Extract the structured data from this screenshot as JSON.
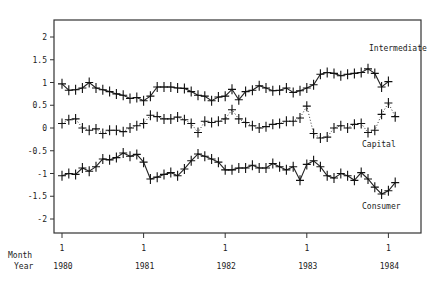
{
  "chart_data": {
    "type": "line",
    "title": "",
    "xlabel_rows": [
      "Month",
      "Year"
    ],
    "ylabel": "",
    "ylim": [
      -2.4,
      2.4
    ],
    "yticks": [
      2,
      1.5,
      1,
      0.5,
      0,
      -0.5,
      -1,
      -1.5,
      -2
    ],
    "ytick_labels": [
      "2",
      "1.5",
      "1",
      "0.5",
      "0",
      "-0.5",
      "-1",
      "-1.5",
      "-2"
    ],
    "xticks": [
      {
        "month": "1",
        "year": "1980",
        "index": 0
      },
      {
        "month": "1",
        "year": "1981",
        "index": 12
      },
      {
        "month": "1",
        "year": "1982",
        "index": 24
      },
      {
        "month": "1",
        "year": "1983",
        "index": 36
      },
      {
        "month": "1",
        "year": "1984",
        "index": 48
      }
    ],
    "grid": false,
    "legend": "inline labels",
    "marker": "+",
    "series": [
      {
        "name": "Intermediate",
        "line_style": "solid",
        "label_pos": [
          369,
          51
        ],
        "values": [
          0.97,
          0.83,
          0.84,
          0.88,
          1.0,
          0.88,
          0.84,
          0.8,
          0.75,
          0.72,
          0.65,
          0.67,
          0.6,
          0.7,
          0.9,
          0.9,
          0.9,
          0.88,
          0.87,
          0.8,
          0.72,
          0.7,
          0.6,
          0.68,
          0.7,
          0.85,
          0.62,
          0.8,
          0.83,
          0.93,
          0.88,
          0.82,
          0.83,
          0.88,
          0.78,
          0.82,
          0.88,
          0.95,
          1.18,
          1.22,
          1.2,
          1.15,
          1.18,
          1.2,
          1.22,
          1.3,
          1.2,
          0.9,
          1.02
        ]
      },
      {
        "name": "Capital",
        "line_style": "dotted",
        "label_pos": [
          362,
          147
        ],
        "values": [
          0.1,
          0.18,
          0.2,
          0.0,
          -0.05,
          -0.02,
          -0.12,
          -0.05,
          -0.05,
          -0.08,
          0.0,
          0.05,
          0.1,
          0.28,
          0.25,
          0.2,
          0.2,
          0.24,
          0.18,
          0.1,
          -0.1,
          0.15,
          0.12,
          0.15,
          0.2,
          0.4,
          0.2,
          0.12,
          0.05,
          0.0,
          0.03,
          0.08,
          0.1,
          0.15,
          0.15,
          0.22,
          0.48,
          -0.12,
          -0.22,
          -0.2,
          0.0,
          0.05,
          0.0,
          0.08,
          0.1,
          -0.1,
          -0.05,
          0.3,
          0.55,
          0.25
        ]
      },
      {
        "name": "Consumer",
        "line_style": "solid",
        "label_pos": [
          362,
          209
        ],
        "values": [
          -1.05,
          -1.0,
          -1.02,
          -0.88,
          -0.95,
          -0.85,
          -0.68,
          -0.7,
          -0.65,
          -0.55,
          -0.62,
          -0.58,
          -0.75,
          -1.12,
          -1.08,
          -1.02,
          -0.98,
          -1.05,
          -0.9,
          -0.72,
          -0.57,
          -0.62,
          -0.68,
          -0.75,
          -0.92,
          -0.92,
          -0.88,
          -0.88,
          -0.82,
          -0.88,
          -0.88,
          -0.78,
          -0.85,
          -0.92,
          -0.85,
          -1.15,
          -0.8,
          -0.72,
          -0.85,
          -1.05,
          -1.1,
          -1.0,
          -1.05,
          -1.15,
          -0.98,
          -1.12,
          -1.3,
          -1.45,
          -1.38,
          -1.2
        ]
      }
    ]
  }
}
